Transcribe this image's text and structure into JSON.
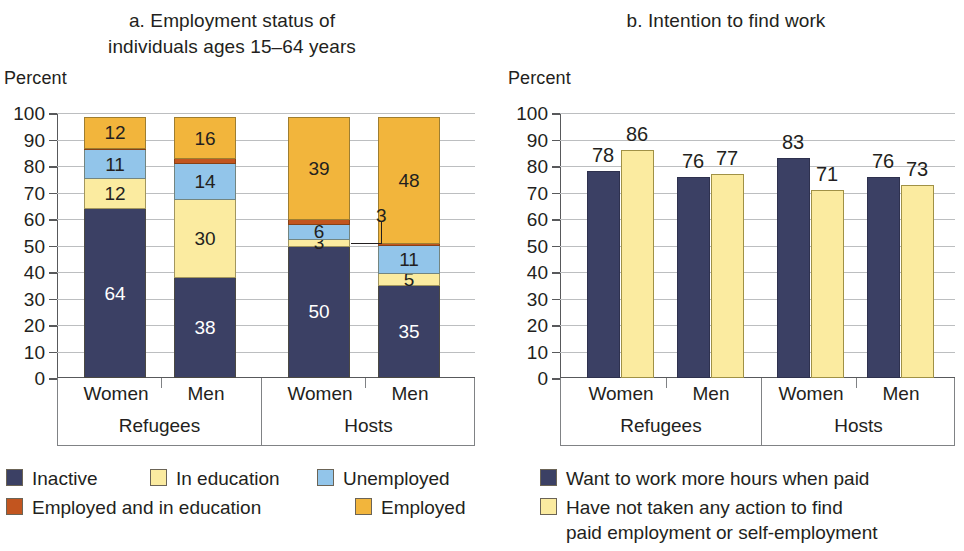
{
  "colors": {
    "inactive": "#3b4064",
    "in_education": "#fbeba0",
    "unemployed": "#92c5ea",
    "employed_and_in_education": "#c2551f",
    "employed": "#f2b53c",
    "want_more_hours": "#3b4064",
    "no_action": "#fbeba0",
    "gridline": "#bcbec0",
    "axis": "#58595b"
  },
  "panel_a": {
    "title": "a. Employment status of\nindividuals ages 15–64 years",
    "title_line1": "a. Employment status of",
    "title_line2": "individuals ages 15–64 years",
    "axis_unit": "Percent",
    "y_ticks": [
      "100",
      "90",
      "80",
      "70",
      "60",
      "50",
      "40",
      "30",
      "20",
      "10",
      "0"
    ],
    "groups": [
      {
        "name": "Refugees",
        "categories": [
          "Women",
          "Men"
        ]
      },
      {
        "name": "Hosts",
        "categories": [
          "Women",
          "Men"
        ]
      }
    ],
    "legend": [
      {
        "key": "inactive",
        "label": "Inactive"
      },
      {
        "key": "in_education",
        "label": "In education"
      },
      {
        "key": "unemployed",
        "label": "Unemployed"
      },
      {
        "key": "employed_and_in_education",
        "label": "Employed and in education"
      },
      {
        "key": "employed",
        "label": "Employed"
      }
    ]
  },
  "panel_b": {
    "title": "b. Intention to find work",
    "axis_unit": "Percent",
    "y_ticks": [
      "100",
      "90",
      "80",
      "70",
      "60",
      "50",
      "40",
      "30",
      "20",
      "10",
      "0"
    ],
    "groups": [
      {
        "name": "Refugees",
        "categories": [
          "Women",
          "Men"
        ]
      },
      {
        "name": "Hosts",
        "categories": [
          "Women",
          "Men"
        ]
      }
    ],
    "legend": [
      {
        "key": "want_more_hours",
        "label": "Want to work more hours when paid"
      },
      {
        "key": "no_action",
        "label": "Have not taken any action to find\npaid employment or self-employment"
      }
    ]
  },
  "chart_data": [
    {
      "type": "bar",
      "subtype": "stacked-column",
      "panel": "a",
      "title": "a. Employment status of individuals ages 15–64 years",
      "xlabel": "",
      "ylabel": "Percent",
      "ylim": [
        0,
        100
      ],
      "ytick_step": 10,
      "grid": true,
      "legend_position": "bottom-left",
      "categories": [
        "Refugees Women",
        "Refugees Men",
        "Hosts Women",
        "Hosts Men"
      ],
      "group_labels": [
        "Refugees",
        "Refugees",
        "Hosts",
        "Hosts"
      ],
      "series": [
        {
          "name": "Inactive",
          "color": "#3b4064",
          "values": [
            64,
            38,
            50,
            35
          ],
          "labels": [
            "64",
            "38",
            "50",
            "35"
          ]
        },
        {
          "name": "In education",
          "color": "#fbeba0",
          "values": [
            12,
            30,
            3,
            5
          ],
          "labels": [
            "12",
            "30",
            "3",
            "5"
          ]
        },
        {
          "name": "Unemployed",
          "color": "#92c5ea",
          "values": [
            11,
            14,
            6,
            11
          ],
          "labels": [
            "11",
            "14",
            "6",
            "11"
          ]
        },
        {
          "name": "Employed and in education",
          "color": "#c2551f",
          "values": [
            1,
            2,
            2,
            1
          ],
          "labels": [
            "",
            "",
            "",
            ""
          ]
        },
        {
          "name": "Employed",
          "color": "#f2b53c",
          "values": [
            12,
            16,
            39,
            48
          ],
          "labels": [
            "12",
            "16",
            "39",
            "48"
          ]
        }
      ],
      "annotations": [
        {
          "text": "3",
          "points_to": "Hosts Women / In education",
          "style": "leader-line"
        }
      ]
    },
    {
      "type": "bar",
      "subtype": "grouped-column",
      "panel": "b",
      "title": "b. Intention to find work",
      "xlabel": "",
      "ylabel": "Percent",
      "ylim": [
        0,
        100
      ],
      "ytick_step": 10,
      "grid": true,
      "legend_position": "bottom",
      "categories": [
        "Refugees Women",
        "Refugees Men",
        "Hosts Women",
        "Hosts Men"
      ],
      "group_labels": [
        "Refugees",
        "Refugees",
        "Hosts",
        "Hosts"
      ],
      "series": [
        {
          "name": "Want to work more hours when paid",
          "color": "#3b4064",
          "values": [
            78,
            76,
            83,
            76
          ],
          "labels": [
            "78",
            "76",
            "83",
            "76"
          ]
        },
        {
          "name": "Have not taken any action to find paid employment or self-employment",
          "color": "#fbeba0",
          "values": [
            86,
            77,
            71,
            73
          ],
          "labels": [
            "86",
            "77",
            "71",
            "73"
          ]
        }
      ]
    }
  ]
}
